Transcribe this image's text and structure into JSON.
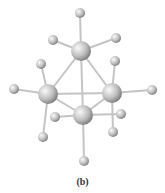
{
  "figure": {
    "label": "(b)",
    "colors": {
      "bond": "#c8c8c8",
      "atom_light": "#f2f2f2",
      "atom_dark": "#8a8a8a"
    },
    "large_atoms": [
      {
        "id": "top",
        "x": 81,
        "y": 51
      },
      {
        "id": "left",
        "x": 48,
        "y": 94
      },
      {
        "id": "right",
        "x": 112,
        "y": 93
      },
      {
        "id": "bottom",
        "x": 83,
        "y": 115
      }
    ],
    "small_atoms": [
      {
        "x": 80,
        "y": 13
      },
      {
        "x": 53,
        "y": 40
      },
      {
        "x": 116,
        "y": 38
      },
      {
        "x": 14,
        "y": 89
      },
      {
        "x": 152,
        "y": 90
      },
      {
        "x": 41,
        "y": 64
      },
      {
        "x": 115,
        "y": 61
      },
      {
        "x": 43,
        "y": 137
      },
      {
        "x": 113,
        "y": 132
      },
      {
        "x": 55,
        "y": 117
      },
      {
        "x": 121,
        "y": 114
      },
      {
        "x": 84,
        "y": 161
      }
    ]
  }
}
